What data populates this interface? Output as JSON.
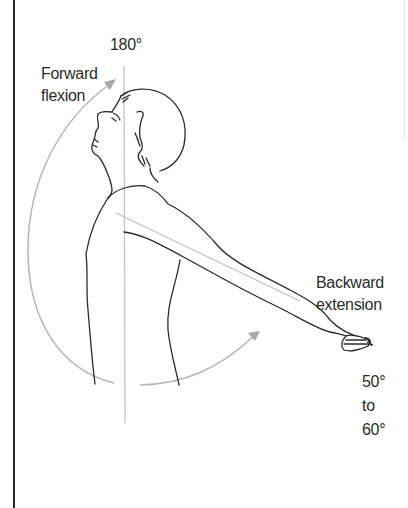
{
  "figure": {
    "labels": {
      "top_angle": "180°",
      "forward_flexion_line1": "Forward",
      "forward_flexion_line2": "flexion",
      "backward_extension_line1": "Backward",
      "backward_extension_line2": "extension",
      "extension_range_line1": "50°",
      "extension_range_line2": "to",
      "extension_range_line3": "60°"
    },
    "colors": {
      "outline": "#2b2b2b",
      "guide_line": "#bdbdbd",
      "arc": "#b5b5b5",
      "frame": "#2a2a2a"
    }
  }
}
